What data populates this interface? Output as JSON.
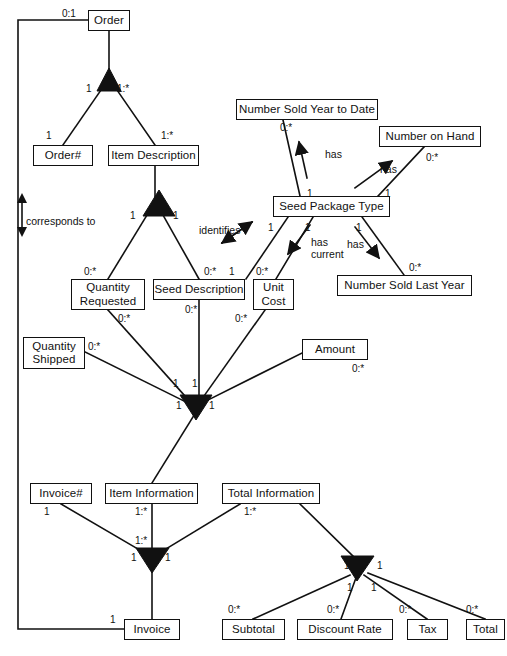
{
  "diagram": {
    "canvas": {
      "width": 507,
      "height": 656
    },
    "colors": {
      "line": "#111111",
      "box_fill": "#ffffff",
      "box_stroke": "#111111",
      "text": "#111111"
    },
    "entities": [
      {
        "id": "order",
        "label": "Order",
        "x": 88,
        "y": 10,
        "w": 42,
        "h": 21
      },
      {
        "id": "order_num",
        "label": "Order#",
        "x": 33,
        "y": 145,
        "w": 60,
        "h": 21
      },
      {
        "id": "item_description",
        "label": "Item Description",
        "x": 108,
        "y": 145,
        "w": 91,
        "h": 21
      },
      {
        "id": "quantity_requested",
        "label": "Quantity\nRequested",
        "x": 71,
        "y": 279,
        "w": 74,
        "h": 31
      },
      {
        "id": "seed_description",
        "label": "Seed Description",
        "x": 153,
        "y": 279,
        "w": 92,
        "h": 21
      },
      {
        "id": "unit_cost",
        "label": "Unit\nCost",
        "x": 253,
        "y": 279,
        "w": 41,
        "h": 31
      },
      {
        "id": "seed_package_type",
        "label": "Seed Package Type",
        "x": 273,
        "y": 196,
        "w": 117,
        "h": 21
      },
      {
        "id": "num_sold_ytd",
        "label": "Number Sold Year to Date",
        "x": 236,
        "y": 99,
        "w": 142,
        "h": 21
      },
      {
        "id": "num_on_hand",
        "label": "Number on Hand",
        "x": 379,
        "y": 126,
        "w": 102,
        "h": 21
      },
      {
        "id": "num_sold_last_yr",
        "label": "Number Sold Last Year",
        "x": 337,
        "y": 275,
        "w": 135,
        "h": 21
      },
      {
        "id": "quantity_shipped",
        "label": "Quantity\nShipped",
        "x": 23,
        "y": 337,
        "w": 62,
        "h": 32
      },
      {
        "id": "amount",
        "label": "Amount",
        "x": 302,
        "y": 339,
        "w": 66,
        "h": 21
      },
      {
        "id": "invoice_num",
        "label": "Invoice#",
        "x": 30,
        "y": 483,
        "w": 62,
        "h": 21
      },
      {
        "id": "item_information",
        "label": "Item Information",
        "x": 105,
        "y": 483,
        "w": 93,
        "h": 21
      },
      {
        "id": "total_information",
        "label": "Total Information",
        "x": 222,
        "y": 483,
        "w": 98,
        "h": 21
      },
      {
        "id": "invoice",
        "label": "Invoice",
        "x": 124,
        "y": 619,
        "w": 56,
        "h": 21
      },
      {
        "id": "subtotal",
        "label": "Subtotal",
        "x": 222,
        "y": 619,
        "w": 63,
        "h": 21
      },
      {
        "id": "discount_rate",
        "label": "Discount Rate",
        "x": 297,
        "y": 619,
        "w": 96,
        "h": 21
      },
      {
        "id": "tax",
        "label": "Tax",
        "x": 407,
        "y": 619,
        "w": 41,
        "h": 21
      },
      {
        "id": "total",
        "label": "Total",
        "x": 466,
        "y": 619,
        "w": 39,
        "h": 21
      }
    ],
    "cardinalities": [
      {
        "id": "c_order_self",
        "text": "0:1",
        "x": 62,
        "y": 8
      },
      {
        "id": "c_order_left",
        "text": "1",
        "x": 86,
        "y": 83
      },
      {
        "id": "c_order_right",
        "text": "1:*",
        "x": 117,
        "y": 83
      },
      {
        "id": "c_ordernum",
        "text": "1",
        "x": 46,
        "y": 130
      },
      {
        "id": "c_itemdesc_top",
        "text": "1:*",
        "x": 161,
        "y": 130
      },
      {
        "id": "c_itemdesc_tri_l",
        "text": "1",
        "x": 130,
        "y": 210
      },
      {
        "id": "c_itemdesc_tri_r",
        "text": "1",
        "x": 173,
        "y": 210
      },
      {
        "id": "c_qty_req",
        "text": "0:*",
        "x": 84,
        "y": 266
      },
      {
        "id": "c_seed_desc_top",
        "text": "0:*",
        "x": 204,
        "y": 266
      },
      {
        "id": "c_seed_desc_ident",
        "text": "1",
        "x": 229,
        "y": 266
      },
      {
        "id": "c_unit_cost_top",
        "text": "0:*",
        "x": 256,
        "y": 266
      },
      {
        "id": "c_qty_req_bot",
        "text": "0:*",
        "x": 118,
        "y": 313
      },
      {
        "id": "c_seed_desc_bot",
        "text": "0:*",
        "x": 185,
        "y": 304
      },
      {
        "id": "c_unit_cost_bot",
        "text": "0:*",
        "x": 235,
        "y": 313
      },
      {
        "id": "c_qty_ship",
        "text": "0:*",
        "x": 88,
        "y": 341
      },
      {
        "id": "c_amount_bot",
        "text": "0:*",
        "x": 352,
        "y": 363
      },
      {
        "id": "c_spine_qreq",
        "text": "1",
        "x": 173,
        "y": 378
      },
      {
        "id": "c_spine_seed",
        "text": "1",
        "x": 192,
        "y": 378
      },
      {
        "id": "c_spine_left",
        "text": "1",
        "x": 176,
        "y": 400
      },
      {
        "id": "c_spine_right",
        "text": "1",
        "x": 209,
        "y": 400
      },
      {
        "id": "c_spt_ytd",
        "text": "1",
        "x": 307,
        "y": 188
      },
      {
        "id": "c_ytd_top",
        "text": "0:*",
        "x": 280,
        "y": 122
      },
      {
        "id": "c_spt_onhand",
        "text": "1",
        "x": 385,
        "y": 188
      },
      {
        "id": "c_onhand_bot",
        "text": "0:*",
        "x": 426,
        "y": 152
      },
      {
        "id": "c_spt_identifies",
        "text": "1",
        "x": 268,
        "y": 222
      },
      {
        "id": "c_spt_unitcost",
        "text": "1",
        "x": 305,
        "y": 222
      },
      {
        "id": "c_spt_lastyr",
        "text": "1",
        "x": 356,
        "y": 222
      },
      {
        "id": "c_lastyr_top",
        "text": "0:*",
        "x": 409,
        "y": 262
      },
      {
        "id": "c_invoicenum",
        "text": "1",
        "x": 44,
        "y": 506
      },
      {
        "id": "c_iteminfo_top",
        "text": "1:*",
        "x": 135,
        "y": 506
      },
      {
        "id": "c_totalinfo_top",
        "text": "1:*",
        "x": 244,
        "y": 506
      },
      {
        "id": "c_iteminfo_mid",
        "text": "1:*",
        "x": 135,
        "y": 535
      },
      {
        "id": "c_inv_tri_l",
        "text": "1",
        "x": 131,
        "y": 552
      },
      {
        "id": "c_inv_tri_r",
        "text": "1",
        "x": 165,
        "y": 552
      },
      {
        "id": "c_invoice_bot",
        "text": "1",
        "x": 110,
        "y": 614
      },
      {
        "id": "c_tot_tri_l",
        "text": "1",
        "x": 344,
        "y": 560
      },
      {
        "id": "c_tot_tri_r",
        "text": "1",
        "x": 377,
        "y": 560
      },
      {
        "id": "c_tot_tri_l2",
        "text": "1",
        "x": 347,
        "y": 582
      },
      {
        "id": "c_tot_tri_r2",
        "text": "1",
        "x": 371,
        "y": 582
      },
      {
        "id": "c_subtotal",
        "text": "0:*",
        "x": 228,
        "y": 604
      },
      {
        "id": "c_discount",
        "text": "0:*",
        "x": 327,
        "y": 604
      },
      {
        "id": "c_tax",
        "text": "0:*",
        "x": 399,
        "y": 604
      },
      {
        "id": "c_total",
        "text": "0:*",
        "x": 466,
        "y": 604
      }
    ],
    "verb_labels": [
      {
        "id": "v_corresponds_to",
        "text": "corresponds to",
        "x": 26,
        "y": 215
      },
      {
        "id": "v_identifies",
        "text": "identifies",
        "x": 199,
        "y": 224
      },
      {
        "id": "v_has_ytd",
        "text": "has",
        "x": 325,
        "y": 148
      },
      {
        "id": "v_has_onhand",
        "text": "has",
        "x": 380,
        "y": 163
      },
      {
        "id": "v_has_current",
        "text": "has\ncurrent",
        "x": 311,
        "y": 236
      },
      {
        "id": "v_has_lastyr",
        "text": "has",
        "x": 347,
        "y": 238
      }
    ],
    "footer_caption": {
      "text": "",
      "x": 230,
      "y": 650
    }
  }
}
